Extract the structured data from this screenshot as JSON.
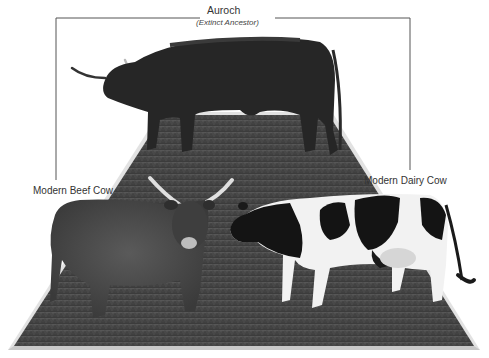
{
  "diagram": {
    "ancestor": {
      "label": "Auroch",
      "sublabel": "(Extinct Ancestor)"
    },
    "descendants": [
      {
        "label": "Modern Beef Cow"
      },
      {
        "label": "Modern Dairy Cow"
      }
    ],
    "colors": {
      "bracket_line": "#555555",
      "label_text": "#333333",
      "platform_fill": "#4a4a4a",
      "platform_border": "#cfcfcf",
      "background": "#ffffff"
    }
  }
}
